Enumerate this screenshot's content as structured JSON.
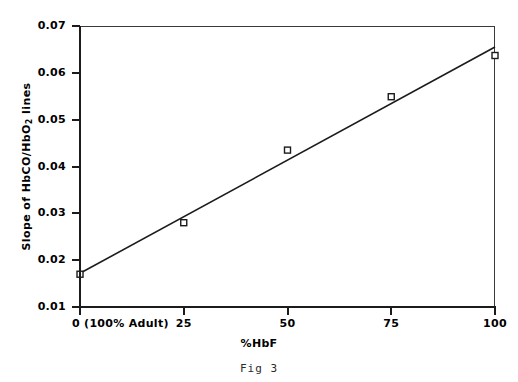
{
  "figure": {
    "caption": "Fig 3"
  },
  "chart_data": {
    "type": "scatter",
    "title": "",
    "xlabel": "%HbF",
    "ylabel": "Slope of HbCO/HbO2 lines",
    "ylabel_parts": {
      "before": "Slope of HbCO/HbO",
      "subscript": "2",
      "after": " lines"
    },
    "xlim": [
      0,
      100
    ],
    "ylim": [
      0.01,
      0.07
    ],
    "grid": false,
    "legend": null,
    "xticks": [
      0,
      25,
      50,
      75,
      100
    ],
    "xticklabels": [
      "0 (100% Adult)",
      "25",
      "50",
      "75",
      "100"
    ],
    "yticks": [
      0.01,
      0.02,
      0.03,
      0.04,
      0.05,
      0.06,
      0.07
    ],
    "yticklabels": [
      "0.01",
      "0.02",
      "0.03",
      "0.04",
      "0.05",
      "0.06",
      "0.07"
    ],
    "marker": "open-square",
    "series": [
      {
        "name": "Slope of HbCO/HbO2 lines",
        "x": [
          0,
          25,
          50,
          75,
          100
        ],
        "values": [
          0.017,
          0.028,
          0.0435,
          0.0549,
          0.0637
        ]
      }
    ],
    "fit_line": {
      "type": "linear",
      "x": [
        0,
        100
      ],
      "values": [
        0.0172,
        0.0655
      ]
    }
  }
}
